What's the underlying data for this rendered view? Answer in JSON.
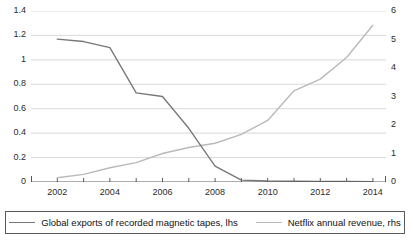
{
  "chart_data": {
    "type": "line",
    "title": "",
    "xlabel": "",
    "x": [
      2002,
      2003,
      2004,
      2005,
      2006,
      2007,
      2008,
      2009,
      2010,
      2011,
      2012,
      2013,
      2014
    ],
    "x_tick_labels": [
      "2002",
      "2004",
      "2006",
      "2008",
      "2010",
      "2012",
      "2014"
    ],
    "xlim": [
      2001,
      2014.5
    ],
    "grid": true,
    "legend_position": "bottom",
    "axes": {
      "left": {
        "label": "lhs",
        "ylim": [
          0,
          1.4
        ],
        "ticks": [
          0,
          0.2,
          0.4,
          0.6,
          0.8,
          1.0,
          1.2,
          1.4
        ],
        "tick_labels": [
          "0",
          "0.2",
          "0.4",
          "0.6",
          "0.8",
          "1",
          "1.2",
          "1.4"
        ]
      },
      "right": {
        "label": "rhs",
        "ylim": [
          0,
          6
        ],
        "ticks": [
          0,
          1,
          2,
          3,
          4,
          5,
          6
        ],
        "tick_labels": [
          "0",
          "1",
          "2",
          "3",
          "4",
          "5",
          "6"
        ]
      }
    },
    "series": [
      {
        "name": "Global exports of recorded magnetic tapes, lhs",
        "axis": "left",
        "color": "#77777a",
        "values": [
          1.17,
          1.15,
          1.1,
          0.73,
          0.7,
          0.44,
          0.13,
          0.015,
          0.008,
          0.006,
          0.005,
          0.004,
          0.003
        ]
      },
      {
        "name": "Netflix annual revenue, rhs",
        "axis": "right",
        "color": "#b9b9bb",
        "values": [
          0.15,
          0.27,
          0.5,
          0.68,
          1.0,
          1.21,
          1.36,
          1.67,
          2.16,
          3.2,
          3.61,
          4.37,
          5.5
        ]
      }
    ]
  },
  "legend": {
    "items": [
      {
        "label": "Global exports of recorded magnetic tapes, lhs",
        "color": "#77777a"
      },
      {
        "label": "Netflix annual revenue, rhs",
        "color": "#b9b9bb"
      }
    ]
  }
}
